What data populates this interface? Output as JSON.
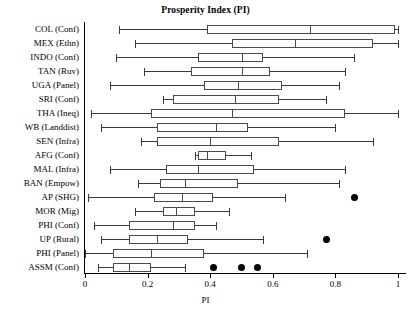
{
  "chart_data": {
    "type": "box",
    "title": "Prosperity Index (PI)",
    "xlabel": "PI",
    "ylabel": "",
    "xlim": [
      0,
      1
    ],
    "xticks": [
      0,
      0.2,
      0.4,
      0.6,
      0.8,
      1
    ],
    "xticklabels": [
      "0",
      "0.2",
      "0.4",
      "0.6",
      "0.8",
      "1"
    ],
    "grid": false,
    "legend": "none",
    "orientation": "horizontal",
    "categories": [
      "COL (Conf)",
      "MEX (Ethn)",
      "INDO (Conf)",
      "TAN (Ruv)",
      "UGA (Panel)",
      "SRI (Conf)",
      "THA (Ineq)",
      "WB (Landdist)",
      "SEN (Infra)",
      "AFG (Conf)",
      "MAL (Infra)",
      "BAN (Empow)",
      "AP (SHG)",
      "MOR (Mig)",
      "PHI (Conf)",
      "UP (Rural)",
      "PHI (Panel)",
      "ASSM (Conf)"
    ],
    "boxes": [
      {
        "label": "COL (Conf)",
        "whisker_low": 0.11,
        "q1": 0.39,
        "median": 0.72,
        "q3": 0.99,
        "whisker_high": 1.0,
        "outliers": []
      },
      {
        "label": "MEX (Ethn)",
        "whisker_low": 0.16,
        "q1": 0.47,
        "median": 0.67,
        "q3": 0.92,
        "whisker_high": 1.0,
        "outliers": []
      },
      {
        "label": "INDO (Conf)",
        "whisker_low": 0.1,
        "q1": 0.36,
        "median": 0.5,
        "q3": 0.57,
        "whisker_high": 0.86,
        "outliers": []
      },
      {
        "label": "TAN (Ruv)",
        "whisker_low": 0.19,
        "q1": 0.34,
        "median": 0.5,
        "q3": 0.59,
        "whisker_high": 0.83,
        "outliers": []
      },
      {
        "label": "UGA (Panel)",
        "whisker_low": 0.08,
        "q1": 0.38,
        "median": 0.49,
        "q3": 0.63,
        "whisker_high": 0.81,
        "outliers": []
      },
      {
        "label": "SRI (Conf)",
        "whisker_low": 0.25,
        "q1": 0.28,
        "median": 0.48,
        "q3": 0.62,
        "whisker_high": 0.77,
        "outliers": []
      },
      {
        "label": "THA (Ineq)",
        "whisker_low": 0.02,
        "q1": 0.21,
        "median": 0.47,
        "q3": 0.83,
        "whisker_high": 1.0,
        "outliers": []
      },
      {
        "label": "WB (Landdist)",
        "whisker_low": 0.05,
        "q1": 0.23,
        "median": 0.42,
        "q3": 0.52,
        "whisker_high": 0.8,
        "outliers": []
      },
      {
        "label": "SEN (Infra)",
        "whisker_low": 0.18,
        "q1": 0.23,
        "median": 0.4,
        "q3": 0.62,
        "whisker_high": 0.92,
        "outliers": []
      },
      {
        "label": "AFG (Conf)",
        "whisker_low": 0.35,
        "q1": 0.36,
        "median": 0.39,
        "q3": 0.45,
        "whisker_high": 0.53,
        "outliers": []
      },
      {
        "label": "MAL (Infra)",
        "whisker_low": 0.08,
        "q1": 0.26,
        "median": 0.36,
        "q3": 0.54,
        "whisker_high": 0.83,
        "outliers": []
      },
      {
        "label": "BAN (Empow)",
        "whisker_low": 0.17,
        "q1": 0.24,
        "median": 0.32,
        "q3": 0.49,
        "whisker_high": 0.81,
        "outliers": []
      },
      {
        "label": "AP (SHG)",
        "whisker_low": 0.01,
        "q1": 0.22,
        "median": 0.31,
        "q3": 0.41,
        "whisker_high": 0.64,
        "outliers": [
          0.86
        ]
      },
      {
        "label": "MOR (Mig)",
        "whisker_low": 0.16,
        "q1": 0.25,
        "median": 0.29,
        "q3": 0.35,
        "whisker_high": 0.46,
        "outliers": []
      },
      {
        "label": "PHI (Conf)",
        "whisker_low": 0.03,
        "q1": 0.14,
        "median": 0.28,
        "q3": 0.35,
        "whisker_high": 0.42,
        "outliers": []
      },
      {
        "label": "UP (Rural)",
        "whisker_low": 0.05,
        "q1": 0.14,
        "median": 0.23,
        "q3": 0.33,
        "whisker_high": 0.57,
        "outliers": [
          0.77
        ]
      },
      {
        "label": "PHI (Panel)",
        "whisker_low": 0.0,
        "q1": 0.09,
        "median": 0.21,
        "q3": 0.38,
        "whisker_high": 0.71,
        "outliers": []
      },
      {
        "label": "ASSM (Conf)",
        "whisker_low": 0.04,
        "q1": 0.09,
        "median": 0.14,
        "q3": 0.21,
        "whisker_high": 0.32,
        "outliers": [
          0.41,
          0.5,
          0.55
        ]
      }
    ]
  },
  "style": {
    "line_color": "#3a3a3a",
    "box_color": "#4a4a4a",
    "outlier_color": "#000000",
    "axis_color": "#000000",
    "background": "#ffffff"
  }
}
